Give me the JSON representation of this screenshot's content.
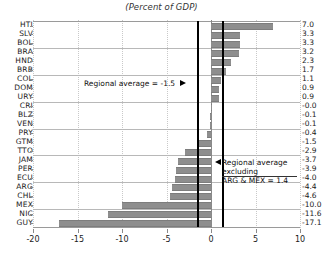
{
  "chart_data": {
    "type": "bar",
    "orientation": "horizontal",
    "title": "(Percent of GDP)",
    "xlabel": "",
    "ylabel": "",
    "xlim": [
      -20,
      10
    ],
    "grid": true,
    "legend_position": "none",
    "xticks": [
      -20,
      -15,
      -10,
      -5,
      0,
      5,
      10
    ],
    "xtick_labels": [
      "-20",
      "-15",
      "-10",
      "-5",
      "0",
      "5",
      "10"
    ],
    "categories": [
      "HTI",
      "SLV",
      "BOL",
      "BRA",
      "HND",
      "BRB",
      "COL",
      "DOM",
      "URY",
      "CRI",
      "BLZ",
      "VEN",
      "PRY",
      "GTM",
      "TTO",
      "JAM",
      "PER",
      "ECU",
      "ARG",
      "CHL",
      "MEX",
      "NIC",
      "GUY"
    ],
    "values": [
      7.0,
      3.3,
      3.3,
      3.2,
      2.3,
      1.7,
      1.1,
      0.9,
      0.9,
      -0.0,
      -0.1,
      -0.1,
      -0.4,
      -1.5,
      -2.9,
      -3.7,
      -3.9,
      -4.0,
      -4.4,
      -4.6,
      -10.0,
      -11.6,
      -17.1
    ],
    "value_labels": [
      "7.0",
      "3.3",
      "3.3",
      "3.2",
      "2.3",
      "1.7",
      "1.1",
      "0.9",
      "0.9",
      "-0.0",
      "-0.1",
      "-0.1",
      "-0.4",
      "-1.5",
      "-2.9",
      "-3.7",
      "-3.9",
      "-4.0",
      "-4.4",
      "-4.6",
      "-10.0",
      "-11.6",
      "-17.1"
    ],
    "bar_color": "#8e8e8e",
    "reference_lines": [
      {
        "name": "regional-average",
        "value": -1.5,
        "color": "#000000"
      },
      {
        "name": "regional-average-excluding-arg-mex",
        "value": 1.4,
        "color": "#000000"
      }
    ],
    "annotations": [
      {
        "name": "regional-average",
        "text": "Regional average = -1.5",
        "arrow": "right"
      },
      {
        "name": "regional-average-excluding",
        "line1": "Regional average",
        "line2": "excluding",
        "line3": "ARG & MEX = 1.4",
        "arrow": "left"
      }
    ]
  },
  "annotation_avg": "Regional average = -1.5",
  "annotation_excl": {
    "line1": "Regional average",
    "line2": "excluding",
    "line3": "ARG & MEX = 1.4"
  }
}
